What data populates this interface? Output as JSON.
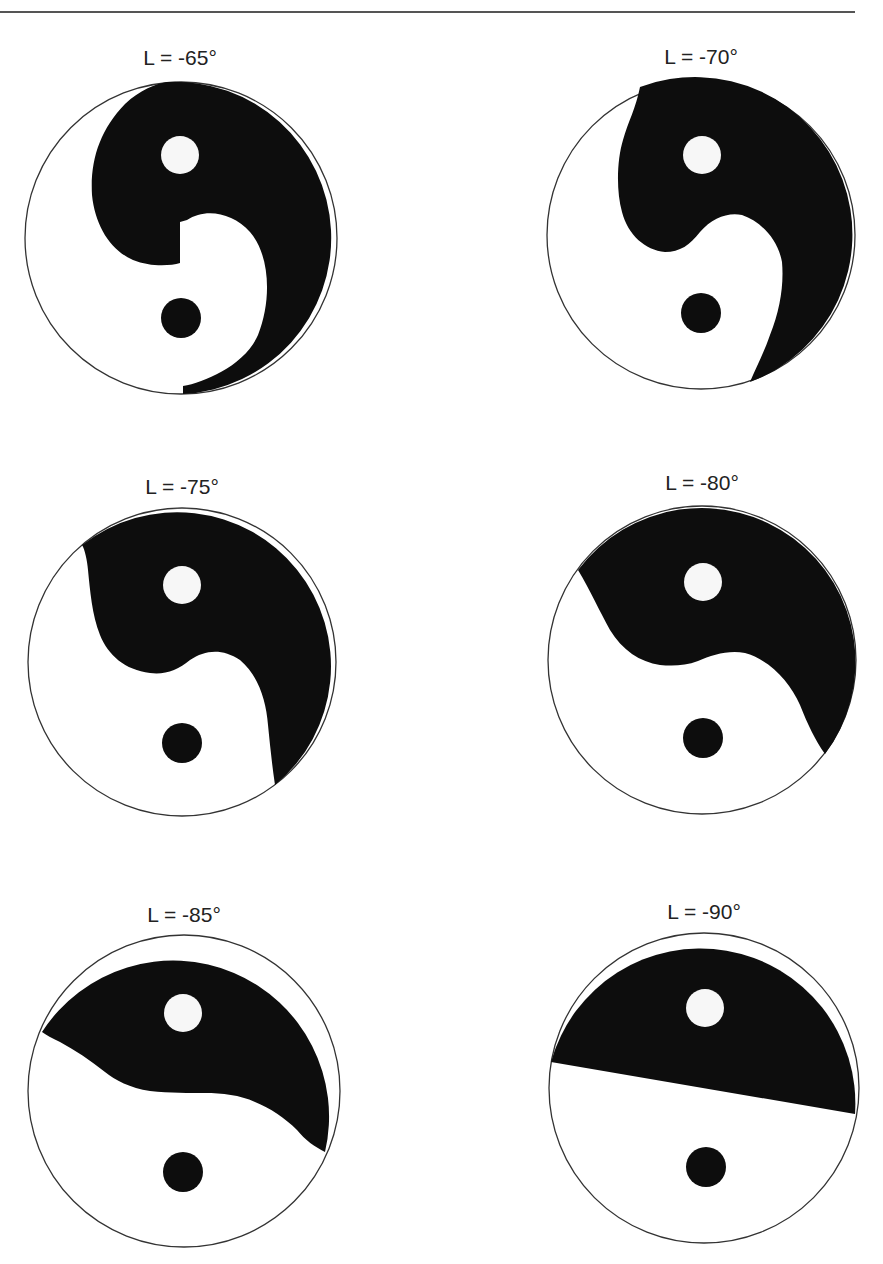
{
  "header": {
    "text": "",
    "rule": true
  },
  "colors": {
    "dark": "#0d0d0d",
    "light": "#ffffff",
    "outline": "#333333"
  },
  "panels": [
    {
      "id": "p1",
      "label": "L = -65°",
      "longitude_deg": -65,
      "label_pos": [
        180,
        65
      ],
      "center": [
        181,
        238
      ],
      "radius": 156,
      "top_dot": {
        "center": [
          180,
          155
        ],
        "radius": 19,
        "color": "light"
      },
      "bottom_dot": {
        "center": [
          181,
          318
        ],
        "radius": 20,
        "color": "dark"
      }
    },
    {
      "id": "p2",
      "label": "L = -70°",
      "longitude_deg": -70,
      "label_pos": [
        701,
        64
      ],
      "center": [
        701,
        235
      ],
      "radius": 154,
      "top_dot": {
        "center": [
          702,
          155
        ],
        "radius": 19,
        "color": "light"
      },
      "bottom_dot": {
        "center": [
          701,
          313
        ],
        "radius": 20,
        "color": "dark"
      }
    },
    {
      "id": "p3",
      "label": "L = -75°",
      "longitude_deg": -75,
      "label_pos": [
        182,
        494
      ],
      "center": [
        182,
        662
      ],
      "radius": 154,
      "top_dot": {
        "center": [
          182,
          585
        ],
        "radius": 19,
        "color": "light"
      },
      "bottom_dot": {
        "center": [
          182,
          743
        ],
        "radius": 20,
        "color": "dark"
      }
    },
    {
      "id": "p4",
      "label": "L = -80°",
      "longitude_deg": -80,
      "label_pos": [
        702,
        490
      ],
      "center": [
        702,
        660
      ],
      "radius": 154,
      "top_dot": {
        "center": [
          703,
          582
        ],
        "radius": 19,
        "color": "light"
      },
      "bottom_dot": {
        "center": [
          703,
          738
        ],
        "radius": 20,
        "color": "dark"
      }
    },
    {
      "id": "p5",
      "label": "L = -85°",
      "longitude_deg": -85,
      "label_pos": [
        184,
        922
      ],
      "center": [
        184,
        1091
      ],
      "radius": 156,
      "top_dot": {
        "center": [
          183,
          1013
        ],
        "radius": 19,
        "color": "light"
      },
      "bottom_dot": {
        "center": [
          183,
          1172
        ],
        "radius": 20,
        "color": "dark"
      }
    },
    {
      "id": "p6",
      "label": "L = -90°",
      "longitude_deg": -90,
      "label_pos": [
        704,
        919
      ],
      "center": [
        704,
        1088
      ],
      "radius": 155,
      "top_dot": {
        "center": [
          705,
          1008
        ],
        "radius": 19,
        "color": "light"
      },
      "bottom_dot": {
        "center": [
          706,
          1167
        ],
        "radius": 20,
        "color": "dark"
      }
    }
  ]
}
